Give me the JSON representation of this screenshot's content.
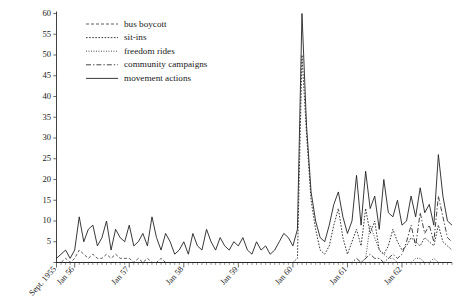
{
  "figure": {
    "width": 465,
    "height": 306,
    "background": "#ffffff",
    "ink_color": "#232323"
  },
  "chart_data": {
    "type": "line",
    "title": "",
    "subtitle": "",
    "xlabel": "",
    "ylabel": "",
    "ylim": [
      0,
      60
    ],
    "yticks": [
      0,
      5,
      10,
      15,
      20,
      25,
      30,
      35,
      40,
      45,
      50,
      55,
      60
    ],
    "ytick_labels": [
      "",
      "5",
      "10",
      "15",
      "20",
      "25",
      "30",
      "35",
      "40",
      "45",
      "50",
      "55",
      "60"
    ],
    "grid": false,
    "legend_position": "top-left",
    "x_axis": {
      "unit": "month",
      "start": "Sept. 1955",
      "end": "Dec. 1962",
      "n_points": 88,
      "minor_ticks": "monthly",
      "major_tick_labels": [
        "Sept. 1955",
        "Jan 56",
        "Jan 57",
        "Jan 58",
        "Jan 59",
        "Jan 60",
        "Jan 61",
        "Jan 62"
      ],
      "major_tick_indices": [
        0,
        4,
        16,
        28,
        40,
        52,
        64,
        76
      ]
    },
    "series": [
      {
        "name": "bus boycott",
        "style": "dashed",
        "dasharray": "3,2",
        "width": 0.75,
        "values": [
          0,
          0,
          1,
          0,
          1,
          3,
          2,
          1,
          2,
          1,
          1,
          2,
          1,
          2,
          1,
          1,
          1,
          0,
          1,
          0,
          1,
          0,
          0,
          1,
          0,
          0,
          0,
          0,
          0,
          0,
          0,
          0,
          0,
          0,
          0,
          0,
          0,
          0,
          0,
          0,
          0,
          0,
          0,
          0,
          0,
          0,
          0,
          0,
          0,
          0,
          0,
          0,
          0,
          0,
          0,
          0,
          0,
          0,
          0,
          0,
          0,
          0,
          0,
          0,
          0,
          0,
          0,
          0,
          0,
          0,
          0,
          0,
          0,
          0,
          0,
          0,
          0,
          0,
          0,
          0,
          0,
          0,
          0,
          0,
          0,
          0,
          0,
          0
        ]
      },
      {
        "name": "sit-ins",
        "style": "dotted",
        "dasharray": "1.6,1.5",
        "width": 0.9,
        "values": [
          0,
          0,
          0,
          0,
          0,
          0,
          0,
          0,
          0,
          0,
          0,
          0,
          0,
          0,
          0,
          0,
          0,
          0,
          0,
          0,
          0,
          0,
          0,
          0,
          0,
          0,
          0,
          0,
          0,
          0,
          0,
          0,
          0,
          0,
          0,
          0,
          0,
          0,
          0,
          0,
          0,
          0,
          0,
          0,
          0,
          0,
          0,
          0,
          0,
          0,
          0,
          0,
          0,
          1,
          50,
          31,
          15,
          8,
          3,
          2,
          4,
          9,
          13,
          6,
          2,
          5,
          8,
          4,
          13,
          7,
          10,
          3,
          2,
          4,
          8,
          5,
          3,
          4,
          6,
          5,
          4,
          6,
          5,
          4,
          9,
          5,
          4,
          3
        ]
      },
      {
        "name": "freedom rides",
        "style": "fine-dotted",
        "dasharray": "0.9,1.6",
        "width": 0.9,
        "values": [
          0,
          0,
          0,
          0,
          0,
          0,
          0,
          0,
          0,
          0,
          0,
          0,
          0,
          0,
          0,
          0,
          0,
          0,
          0,
          0,
          0,
          0,
          0,
          0,
          0,
          0,
          0,
          0,
          0,
          0,
          0,
          0,
          0,
          0,
          0,
          0,
          0,
          0,
          0,
          0,
          0,
          0,
          0,
          0,
          0,
          0,
          0,
          0,
          0,
          0,
          0,
          0,
          0,
          0,
          0,
          0,
          0,
          0,
          0,
          0,
          0,
          0,
          0,
          0,
          0,
          0,
          0,
          0,
          1,
          9,
          6,
          3,
          2,
          1,
          1,
          0,
          0,
          0,
          0,
          1,
          1,
          0,
          0,
          1,
          0,
          0,
          0,
          0
        ]
      },
      {
        "name": "community campaigns",
        "style": "dash-dot",
        "dasharray": "5,2,1.4,2",
        "width": 0.85,
        "values": [
          0,
          0,
          0,
          0,
          0,
          0,
          0,
          0,
          0,
          0,
          0,
          0,
          0,
          0,
          0,
          0,
          0,
          0,
          0,
          0,
          0,
          0,
          0,
          0,
          0,
          0,
          0,
          0,
          0,
          0,
          0,
          0,
          0,
          0,
          0,
          0,
          0,
          0,
          0,
          0,
          0,
          0,
          0,
          0,
          0,
          0,
          0,
          0,
          0,
          0,
          0,
          0,
          0,
          0,
          0,
          0,
          0,
          0,
          0,
          0,
          0,
          0,
          0,
          0,
          0,
          0,
          1,
          0,
          1,
          2,
          1,
          1,
          0,
          1,
          2,
          1,
          2,
          5,
          9,
          4,
          12,
          7,
          9,
          5,
          16,
          11,
          6,
          5
        ]
      },
      {
        "name": "movement actions",
        "style": "solid",
        "dasharray": "",
        "width": 0.9,
        "values": [
          1,
          2,
          3,
          1,
          3,
          11,
          5,
          8,
          9,
          4,
          6,
          10,
          3,
          8,
          6,
          5,
          9,
          4,
          5,
          7,
          4,
          11,
          6,
          3,
          7,
          5,
          2,
          3,
          5,
          2,
          7,
          4,
          3,
          8,
          5,
          3,
          6,
          4,
          3,
          5,
          4,
          6,
          3,
          2,
          5,
          3,
          4,
          2,
          3,
          5,
          7,
          6,
          4,
          8,
          60,
          33,
          17,
          10,
          6,
          5,
          9,
          14,
          17,
          11,
          7,
          10,
          21,
          9,
          22,
          13,
          16,
          8,
          20,
          12,
          11,
          15,
          9,
          10,
          16,
          11,
          18,
          12,
          14,
          9,
          26,
          16,
          10,
          9
        ]
      }
    ]
  },
  "legend": {
    "items": [
      {
        "label": "bus boycott",
        "style": "dashed"
      },
      {
        "label": "sit-ins",
        "style": "dotted"
      },
      {
        "label": "freedom rides",
        "style": "fine-dotted"
      },
      {
        "label": "community campaigns",
        "style": "dash-dot"
      },
      {
        "label": "movement actions",
        "style": "solid"
      }
    ]
  },
  "axes": {
    "y_tick_labels": [
      "5",
      "10",
      "15",
      "20",
      "25",
      "30",
      "35",
      "40",
      "45",
      "50",
      "55",
      "60"
    ],
    "x_tick_labels": [
      "Sept. 1955",
      "Jan 56",
      "Jan 57",
      "Jan 58",
      "Jan 59",
      "Jan 60",
      "Jan 61",
      "Jan 62"
    ]
  }
}
